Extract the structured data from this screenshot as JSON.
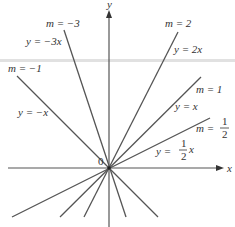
{
  "figure": {
    "origin_label": "0",
    "x_axis_label": "x",
    "y_axis_label": "y",
    "lines": [
      {
        "slope_label": "m = −3",
        "equation": "y = −3x",
        "m": -3
      },
      {
        "slope_label": "m = −1",
        "equation": "y = −x",
        "m": -1
      },
      {
        "slope_label": "m = 2",
        "equation": "y = 2x",
        "m": 2
      },
      {
        "slope_label": "m = 1",
        "equation": "y = x",
        "m": 1
      },
      {
        "slope_label": "m = 1/2",
        "equation": "y = (1/2)x",
        "m": 0.5
      }
    ],
    "labels": {
      "m_neg3": "m = −3",
      "eq_neg3": "y = −3x",
      "m_neg1": "m = −1",
      "eq_neg1": "y = −x",
      "m_2": "m = 2",
      "eq_2": "y = 2x",
      "m_1": "m = 1",
      "eq_1": "y = x",
      "m_half_prefix": "m =",
      "half_num": "1",
      "half_den": "2",
      "eq_half_prefix": "y =",
      "eq_half_suffix": "x"
    },
    "colors": {
      "line": "#555555",
      "text": "#333333",
      "band": "#d9d9d9"
    }
  }
}
